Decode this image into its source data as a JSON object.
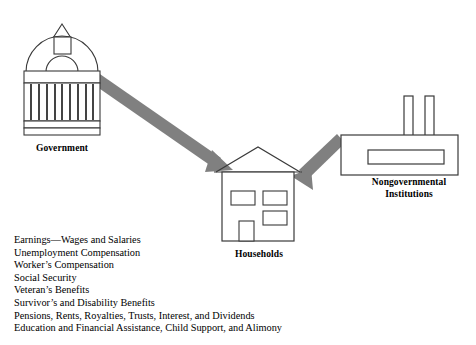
{
  "diagram": {
    "nodes": [
      {
        "id": "government",
        "label": "Government",
        "icon": "capitol-dome-building-icon"
      },
      {
        "id": "households",
        "label": "Households",
        "icon": "house-icon"
      },
      {
        "id": "nongovernmental",
        "label": "Nongovernmental\nInstitutions",
        "label_line1": "Nongovernmental",
        "label_line2": "Institutions",
        "icon": "factory-building-icon"
      }
    ],
    "arrows": [
      {
        "id": "gov-to-households",
        "from": "government",
        "to": "households",
        "color": "#808080"
      },
      {
        "id": "ngo-to-households",
        "from": "nongovernmental",
        "to": "households",
        "color": "#808080"
      }
    ]
  },
  "income_sources": {
    "items": [
      "Earnings—Wages and Salaries",
      "Unemployment Compensation",
      "Worker’s Compensation",
      "Social Security",
      "Veteran’s Benefits",
      "Survivor’s and Disability Benefits",
      "Pensions, Rents, Royalties, Trusts, Interest, and Dividends",
      "Education and Financial Assistance, Child Support, and Alimony"
    ]
  },
  "colors": {
    "stroke": "#3a3a3a",
    "arrow": "#808080",
    "text": "#000000",
    "background": "#ffffff"
  }
}
